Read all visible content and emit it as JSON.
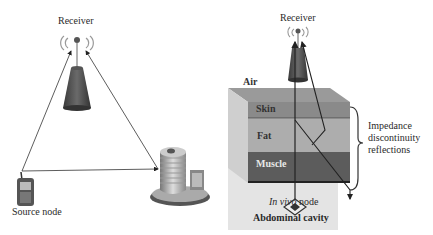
{
  "left_panel": {
    "receiver_label": "Receiver",
    "source_label": "Source node",
    "nodes": [
      {
        "name": "receiver",
        "icon": "antenna-tower-icon"
      },
      {
        "name": "source",
        "icon": "mobile-phone-icon"
      },
      {
        "name": "building",
        "icon": "building-icon"
      }
    ],
    "links": [
      {
        "from": "source",
        "to": "receiver"
      },
      {
        "from": "building",
        "to": "receiver"
      },
      {
        "from": "source",
        "to": "building"
      }
    ]
  },
  "right_panel": {
    "receiver_label": "Receiver",
    "air_label": "Air",
    "layers": [
      {
        "name": "Skin",
        "color": "#8a8a8a"
      },
      {
        "name": "Fat",
        "color": "#a9a9a9"
      },
      {
        "name": "Muscle",
        "color": "#5e5e5e"
      }
    ],
    "node_label_italic": "In vivo",
    "node_label_rest": " node",
    "cavity_label": "Abdominal cavity",
    "brace_label_lines": [
      "Impedance",
      "discontinuity",
      "reflections"
    ]
  },
  "colors": {
    "line": "#333333",
    "tower": "#4a4a4a",
    "cavity_bg": "#e4e4e4"
  }
}
